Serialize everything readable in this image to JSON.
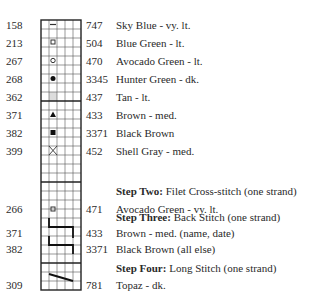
{
  "grid": {
    "columns": 5,
    "rows": 30,
    "left": 41,
    "top": 20,
    "cell_w": 8,
    "cell_h": 9,
    "thick_rows": [
      9,
      18,
      27
    ],
    "line_color": "#333333",
    "shade_color": "#dcdcdc"
  },
  "step_one_rows": [
    {
      "symbol": "dash-icon",
      "left_code": "158",
      "dmc": "747",
      "name": "Sky Blue - vy. lt."
    },
    {
      "symbol": "open-square-icon",
      "left_code": "213",
      "dmc": "504",
      "name": "Blue Green - lt."
    },
    {
      "symbol": "open-circle-icon",
      "left_code": "267",
      "dmc": "470",
      "name": "Avocado Green - lt."
    },
    {
      "symbol": "filled-circle-icon",
      "left_code": "268",
      "dmc": "3345",
      "name": "Hunter Green - dk."
    },
    {
      "symbol": "gray-shade-icon",
      "left_code": "362",
      "dmc": "437",
      "name": "Tan - lt."
    },
    {
      "symbol": "filled-triangle-icon",
      "left_code": "371",
      "dmc": "433",
      "name": "Brown - med."
    },
    {
      "symbol": "filled-square-icon",
      "left_code": "382",
      "dmc": "3371",
      "name": "Black Brown"
    },
    {
      "symbol": "x-cross-icon",
      "left_code": "399",
      "dmc": "452",
      "name": "Shell Gray - med."
    }
  ],
  "step_two": {
    "heading_bold": "Step Two:",
    "heading_rest": " Filet Cross-stitch (one strand)",
    "rows": [
      {
        "symbol": "open-square-icon",
        "left_code": "266",
        "dmc": "471",
        "name": "Avocado Green - vy. lt."
      }
    ]
  },
  "step_three": {
    "heading_bold": "Step Three:",
    "heading_rest": " Back Stitch (one strand)",
    "rows": [
      {
        "symbol": "backstitch-line-icon",
        "left_code": "371",
        "dmc": "433",
        "name": "Brown - med. (name, date)"
      },
      {
        "symbol": "backstitch-line-icon",
        "left_code": "382",
        "dmc": "3371",
        "name": "Black Brown (all else)"
      }
    ]
  },
  "step_four": {
    "heading_bold": "Step Four:",
    "heading_rest": " Long Stitch (one strand)",
    "rows": [
      {
        "symbol": "long-stitch-line-icon",
        "left_code": "309",
        "dmc": "781",
        "name": "Topaz - dk."
      }
    ]
  }
}
